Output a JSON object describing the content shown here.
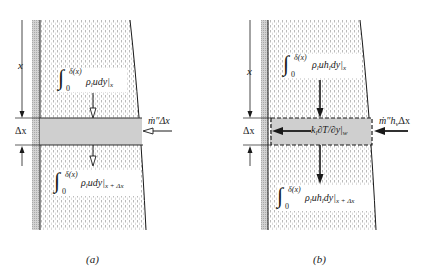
{
  "figure": {
    "panel_a": {
      "caption": "(a)",
      "dimension_x": "x",
      "dimension_dx": "Δx",
      "inflow_label": "ṁ″Δx",
      "top_flux": {
        "integral_sign": "∫",
        "upper_limit": "δ(x)",
        "lower_limit": "0",
        "integrand": "ρ",
        "integrand_sub": "l",
        "integrand_rest": "udy|",
        "eval_at": "x"
      },
      "bottom_flux": {
        "integral_sign": "∫",
        "upper_limit": "δ(x)",
        "lower_limit": "0",
        "integrand": "ρ",
        "integrand_sub": "l",
        "integrand_rest": "udy|",
        "eval_at": "x + Δx"
      }
    },
    "panel_b": {
      "caption": "(b)",
      "dimension_x": "x",
      "dimension_dx": "Δx",
      "inflow_label": "ṁ″h",
      "inflow_sub": "v",
      "inflow_rest": "Δx",
      "wall_flux": {
        "k": "k",
        "k_sub": "l",
        "rest": "∂T/∂y|",
        "eval_at": "w"
      },
      "top_flux": {
        "integral_sign": "∫",
        "upper_limit": "δ(x)",
        "lower_limit": "0",
        "integrand": "ρ",
        "integrand_sub": "l",
        "integrand_mid": "uh",
        "integrand_sub2": "l",
        "integrand_rest": "dy|",
        "eval_at": "x"
      },
      "bottom_flux": {
        "integral_sign": "∫",
        "upper_limit": "δ(x)",
        "lower_limit": "0",
        "integrand": "ρ",
        "integrand_sub": "l",
        "integrand_mid": "uh",
        "integrand_sub2": "l",
        "integrand_rest": "dy|",
        "eval_at": "x + Δx"
      }
    },
    "colors": {
      "ink": "#1a1a1a",
      "wall": "#c8c8c8",
      "band": "#cfcfcf",
      "fluid_dash": "#9a9a9a"
    }
  }
}
